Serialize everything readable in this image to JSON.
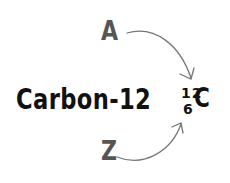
{
  "diagram": {
    "name_label": "Carbon-12",
    "mass_number_label": "A",
    "atomic_number_label": "Z",
    "notation": {
      "mass_number": "12",
      "atomic_number": "6",
      "symbol": "C"
    },
    "arrows": [
      {
        "from": "A",
        "to": "mass_number"
      },
      {
        "from": "Z",
        "to": "atomic_number"
      }
    ],
    "colors": {
      "label_grey": "#555555",
      "text_black": "#111111",
      "arrow_grey": "#777777",
      "background": "#ffffff"
    }
  }
}
